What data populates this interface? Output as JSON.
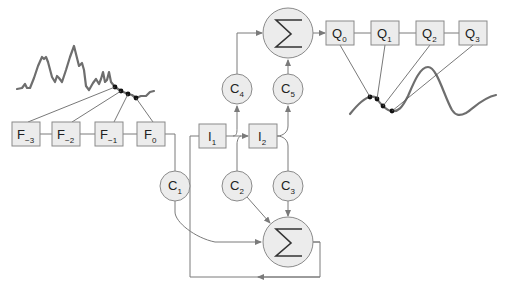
{
  "diagram": {
    "title": "",
    "input_filter_taps": [
      {
        "id": "F-3",
        "base": "F",
        "sub": "−3"
      },
      {
        "id": "F-2",
        "base": "F",
        "sub": "−2"
      },
      {
        "id": "F-1",
        "base": "F",
        "sub": "−1"
      },
      {
        "id": "F0",
        "base": "F",
        "sub": "0"
      }
    ],
    "integrators": [
      {
        "id": "I1",
        "base": "I",
        "sub": "1"
      },
      {
        "id": "I2",
        "base": "I",
        "sub": "2"
      }
    ],
    "coefficients": [
      {
        "id": "C1",
        "base": "C",
        "sub": "1"
      },
      {
        "id": "C2",
        "base": "C",
        "sub": "2"
      },
      {
        "id": "C3",
        "base": "C",
        "sub": "3"
      },
      {
        "id": "C4",
        "base": "C",
        "sub": "4"
      },
      {
        "id": "C5",
        "base": "C",
        "sub": "5"
      }
    ],
    "output_taps": [
      {
        "id": "Q0",
        "base": "Q",
        "sub": "0"
      },
      {
        "id": "Q1",
        "base": "Q",
        "sub": "1"
      },
      {
        "id": "Q2",
        "base": "Q",
        "sub": "2"
      },
      {
        "id": "Q3",
        "base": "Q",
        "sub": "3"
      }
    ],
    "summers": [
      {
        "id": "sum-top",
        "symbol": "Σ"
      },
      {
        "id": "sum-bottom",
        "symbol": "Σ"
      }
    ],
    "signals": {
      "input": "noisy input waveform sampled by F taps",
      "output": "smooth output waveform sampled by Q taps"
    },
    "colors": {
      "node_fill": "#ececec",
      "node_stroke": "#8a8a8a",
      "wire": "#7a7a7a",
      "signal": "#6e6e6e",
      "sample_dot": "#111111"
    }
  }
}
